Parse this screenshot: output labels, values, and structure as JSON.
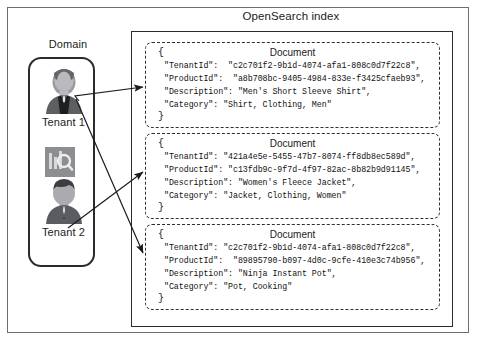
{
  "diagram": {
    "title": "OpenSearch index",
    "domain_label": "Domain",
    "index_glyph_name": "opensearch-index-icon"
  },
  "domain": {
    "tenants": [
      {
        "name": "Tenant 1",
        "avatar_name": "tenant-1-avatar"
      },
      {
        "name": "Tenant 2",
        "avatar_name": "tenant-2-avatar"
      }
    ]
  },
  "documents": [
    {
      "heading": "Document",
      "open_brace": "{",
      "close_brace": "}",
      "lines": [
        "\"TenantId\":  \"c2c701f2-9b1d-4074-afa1-808c0d7f22c8\",",
        "\"ProductId\":  \"a8b708bc-9405-4984-833e-f3425cfaeb93\",",
        "\"Description\": \"Men's Short Sleeve Shirt\",",
        "\"Category\": \"Shirt, Clothing, Men\""
      ],
      "fields": {
        "TenantId": "c2c701f2-9b1d-4074-afa1-808c0d7f22c8",
        "ProductId": "a8b708bc-9405-4984-833e-f3425cfaeb93",
        "Description": "Men's Short Sleeve Shirt",
        "Category": "Shirt, Clothing, Men"
      }
    },
    {
      "heading": "Document",
      "open_brace": "{",
      "close_brace": "}",
      "lines": [
        "\"TenantId\": \"421a4e5e-5455-47b7-8074-ff8db8ec589d\",",
        "\"ProductId\": \"c13fdb9c-9f7d-4f97-82ac-8b82b9d91145\",",
        "\"Description\": \"Women's Fleece Jacket\",",
        "\"Category\": \"Jacket, Clothing, Women\""
      ],
      "fields": {
        "TenantId": "421a4e5e-5455-47b7-8074-ff8db8ec589d",
        "ProductId": "c13fdb9c-9f7d-4f97-82ac-8b82b9d91145",
        "Description": "Women's Fleece Jacket",
        "Category": "Jacket, Clothing, Women"
      }
    },
    {
      "heading": "Document",
      "open_brace": "{",
      "close_brace": "}",
      "lines": [
        "\"TenantId\": \"c2c701f2-9b1d-4074-afa1-808c0d7f22c8\",",
        "\"ProductId\":  \"89895790-b097-4d0c-9cfe-410e3c74b956\",",
        "\"Description\": \"Ninja Instant Pot\",",
        "\"Category\": \"Pot, Cooking\""
      ],
      "fields": {
        "TenantId": "c2c701f2-9b1d-4074-afa1-808c0d7f22c8",
        "ProductId": "89895790-b097-4d0c-9cfe-410e3c74b956",
        "Description": "Ninja Instant Pot",
        "Category": "Pot, Cooking"
      }
    }
  ],
  "connections": [
    {
      "from": "Tenant 1",
      "to": "Document 1"
    },
    {
      "from": "Tenant 1",
      "to": "Document 3"
    },
    {
      "from": "Tenant 2",
      "to": "Document 2"
    }
  ],
  "colors": {
    "frame": "#6e6e6e",
    "box_border": "#2b2b2b",
    "dashed_border": "#2f2f2f",
    "text": "#1b1b1b",
    "avatar_dark": "#55565a",
    "avatar_mid": "#7c7e83",
    "avatar_light": "#aeb0b4",
    "glyph_bg": "#8c8e92"
  }
}
